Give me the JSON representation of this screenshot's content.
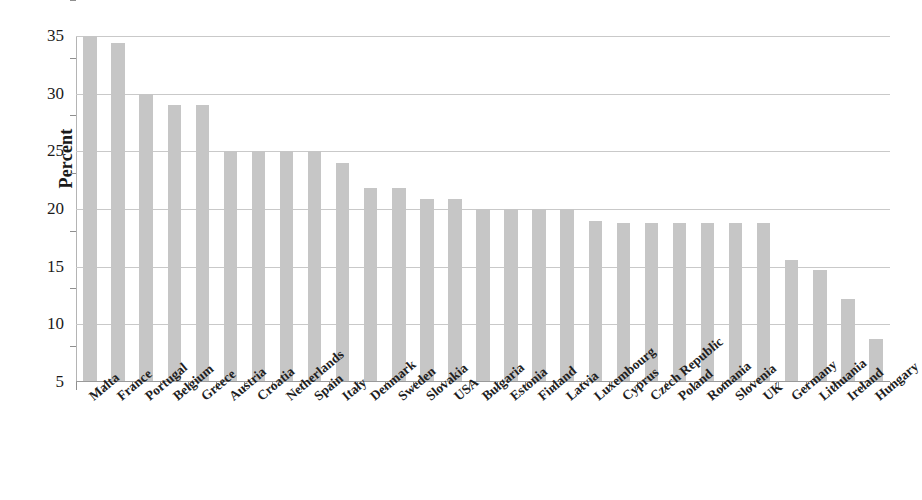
{
  "chart_data": {
    "type": "bar",
    "title": "",
    "subtitle": "",
    "xlabel": "",
    "ylabel": "Percent",
    "ylim": [
      5,
      35
    ],
    "yticks": [
      5,
      10,
      15,
      20,
      25,
      30,
      35
    ],
    "ytick_labels": [
      "5",
      "10",
      "15",
      "20",
      "25",
      "30",
      "35"
    ],
    "grid": true,
    "legend": null,
    "bar_color": "#c6c6c6",
    "categories": [
      "Malta",
      "France",
      "Portugal",
      "Belgium",
      "Greece",
      "Austria",
      "Croatia",
      "Netherlands",
      "Spain",
      "Italy",
      "Denmark",
      "Sweden",
      "Slovakia",
      "USA",
      "Bulgaria",
      "Estonia",
      "Finland",
      "Latvia",
      "Luxembourg",
      "Cyprus",
      "Czech Republic",
      "Poland",
      "Romania",
      "Slovenia",
      "UK",
      "Germany",
      "Lithuania",
      "Ireland",
      "Hungary"
    ],
    "values": [
      35.0,
      34.4,
      30.0,
      29.0,
      29.0,
      25.0,
      25.0,
      25.0,
      25.0,
      24.0,
      21.8,
      21.8,
      20.9,
      20.9,
      20.0,
      20.0,
      20.0,
      20.0,
      19.0,
      18.8,
      18.8,
      18.8,
      18.8,
      18.8,
      18.8,
      15.6,
      14.7,
      12.2,
      8.7
    ]
  },
  "axis": {
    "y_title": "Percent"
  }
}
